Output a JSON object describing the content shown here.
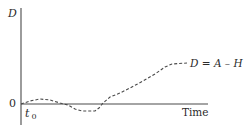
{
  "diagram": {
    "y_axis_label": "D",
    "x_axis_label": "Time",
    "origin_label": "0",
    "t0_label": "t",
    "t0_subscript": "0",
    "curve_label": "D = A – H",
    "colors": {
      "axis": "#4a4a4a",
      "curve": "#4a4a4a",
      "text": "#2b2b2b",
      "background": "#ffffff"
    },
    "curve": {
      "style": "dashed",
      "points": [
        [
          21,
          104
        ],
        [
          30,
          101
        ],
        [
          40,
          99
        ],
        [
          50,
          100
        ],
        [
          60,
          103
        ],
        [
          68,
          105
        ],
        [
          75,
          109
        ],
        [
          82,
          111
        ],
        [
          95,
          111
        ],
        [
          99,
          108
        ],
        [
          103,
          103
        ],
        [
          110,
          97
        ],
        [
          120,
          93
        ],
        [
          130,
          88
        ],
        [
          143,
          81
        ],
        [
          155,
          74
        ],
        [
          165,
          67
        ],
        [
          172,
          64
        ],
        [
          187,
          63
        ]
      ]
    }
  },
  "chart_data": {
    "type": "line",
    "title": "",
    "xlabel": "Time",
    "ylabel": "D",
    "annotations": [
      "t0",
      "0",
      "D = A – H"
    ],
    "series": [
      {
        "name": "D = A – H",
        "style": "dashed",
        "x": [
          0,
          0.05,
          0.1,
          0.16,
          0.21,
          0.25,
          0.29,
          0.32,
          0.39,
          0.42,
          0.44,
          0.48,
          0.53,
          0.59,
          0.65,
          0.72,
          0.77,
          0.81,
          0.89
        ],
        "y": [
          0,
          0.03,
          0.05,
          0.04,
          0.01,
          -0.01,
          -0.05,
          -0.07,
          -0.07,
          -0.04,
          0.01,
          0.07,
          0.11,
          0.16,
          0.23,
          0.3,
          0.37,
          0.4,
          0.41
        ]
      }
    ],
    "xlim": [
      0,
      1
    ],
    "ylim": [
      -0.2,
      1
    ],
    "grid": false
  }
}
